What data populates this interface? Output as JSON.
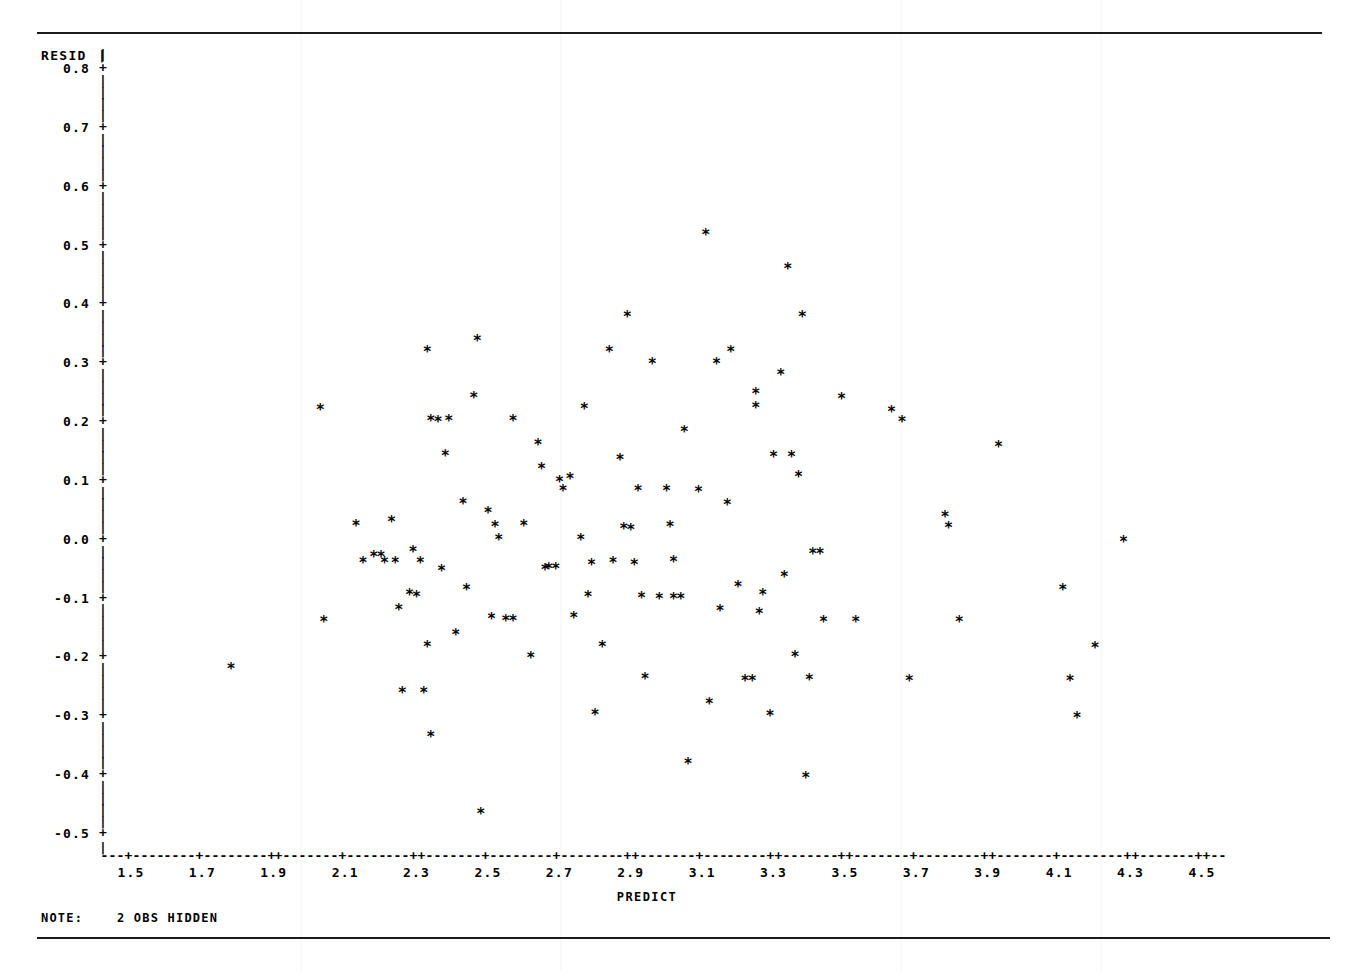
{
  "chart_data": {
    "type": "scatter",
    "title": "",
    "xlabel": "PREDICT",
    "ylabel": "RESID",
    "xlim": [
      1.4,
      4.6
    ],
    "ylim": [
      -0.55,
      0.8
    ],
    "grid": false,
    "legend": null,
    "marker": "*",
    "x_ticks": [
      "1.5",
      "1.7",
      "1.9",
      "2.1",
      "2.3",
      "2.5",
      "2.7",
      "2.9",
      "3.1",
      "3.3",
      "3.5",
      "3.7",
      "3.9",
      "4.1",
      "4.3",
      "4.5"
    ],
    "x_tick_values": [
      1.5,
      1.7,
      1.9,
      2.1,
      2.3,
      2.5,
      2.7,
      2.9,
      3.1,
      3.3,
      3.5,
      3.7,
      3.9,
      4.1,
      4.3,
      4.5
    ],
    "y_ticks": [
      "0.8",
      "0.7",
      "0.6",
      "0.5",
      "0.4",
      "0.3",
      "0.2",
      "0.1",
      "0.0",
      "-0.1",
      "-0.2",
      "-0.3",
      "-0.4",
      "-0.5"
    ],
    "y_tick_values": [
      0.8,
      0.7,
      0.6,
      0.5,
      0.4,
      0.3,
      0.2,
      0.1,
      0.0,
      -0.1,
      -0.2,
      -0.3,
      -0.4,
      -0.5
    ],
    "note": "2 OBS HIDDEN",
    "hidden_obs": 2,
    "points": [
      [
        1.78,
        -0.223
      ],
      [
        2.03,
        0.217
      ],
      [
        2.04,
        -0.143
      ],
      [
        2.13,
        0.02
      ],
      [
        2.15,
        -0.043
      ],
      [
        2.18,
        -0.033
      ],
      [
        2.2,
        -0.033
      ],
      [
        2.21,
        -0.043
      ],
      [
        2.23,
        0.027
      ],
      [
        2.24,
        -0.043
      ],
      [
        2.25,
        -0.122
      ],
      [
        2.26,
        -0.263
      ],
      [
        2.28,
        -0.098
      ],
      [
        2.29,
        -0.024
      ],
      [
        2.3,
        -0.1
      ],
      [
        2.31,
        -0.043
      ],
      [
        2.32,
        -0.263
      ],
      [
        2.33,
        0.316
      ],
      [
        2.33,
        -0.185
      ],
      [
        2.34,
        0.198
      ],
      [
        2.34,
        -0.338
      ],
      [
        2.36,
        0.196
      ],
      [
        2.37,
        -0.057
      ],
      [
        2.38,
        0.139
      ],
      [
        2.39,
        0.198
      ],
      [
        2.41,
        -0.165
      ],
      [
        2.43,
        0.057
      ],
      [
        2.44,
        -0.088
      ],
      [
        2.46,
        0.238
      ],
      [
        2.47,
        0.334
      ],
      [
        2.48,
        -0.47
      ],
      [
        2.5,
        0.042
      ],
      [
        2.51,
        -0.138
      ],
      [
        2.52,
        0.019
      ],
      [
        2.53,
        -0.004
      ],
      [
        2.55,
        -0.141
      ],
      [
        2.57,
        0.199
      ],
      [
        2.57,
        -0.141
      ],
      [
        2.6,
        0.02
      ],
      [
        2.62,
        -0.204
      ],
      [
        2.64,
        0.158
      ],
      [
        2.65,
        0.117
      ],
      [
        2.66,
        -0.054
      ],
      [
        2.67,
        -0.053
      ],
      [
        2.69,
        -0.053
      ],
      [
        2.7,
        0.095
      ],
      [
        2.71,
        0.08
      ],
      [
        2.73,
        0.1
      ],
      [
        2.74,
        -0.136
      ],
      [
        2.76,
        -0.004
      ],
      [
        2.77,
        0.218
      ],
      [
        2.78,
        -0.101
      ],
      [
        2.79,
        -0.046
      ],
      [
        2.8,
        -0.301
      ],
      [
        2.82,
        -0.185
      ],
      [
        2.84,
        0.315
      ],
      [
        2.85,
        -0.043
      ],
      [
        2.87,
        0.132
      ],
      [
        2.88,
        0.015
      ],
      [
        2.89,
        0.375
      ],
      [
        2.9,
        0.014
      ],
      [
        2.91,
        -0.046
      ],
      [
        2.92,
        0.079
      ],
      [
        2.93,
        -0.102
      ],
      [
        2.94,
        -0.24
      ],
      [
        2.96,
        0.296
      ],
      [
        2.98,
        -0.104
      ],
      [
        3.0,
        0.079
      ],
      [
        3.01,
        0.019
      ],
      [
        3.02,
        -0.042
      ],
      [
        3.02,
        -0.104
      ],
      [
        3.04,
        -0.104
      ],
      [
        3.05,
        0.179
      ],
      [
        3.06,
        -0.384
      ],
      [
        3.09,
        0.078
      ],
      [
        3.11,
        0.515
      ],
      [
        3.12,
        -0.283
      ],
      [
        3.14,
        0.296
      ],
      [
        3.15,
        -0.124
      ],
      [
        3.17,
        0.056
      ],
      [
        3.18,
        0.316
      ],
      [
        3.2,
        -0.084
      ],
      [
        3.22,
        -0.243
      ],
      [
        3.24,
        -0.243
      ],
      [
        3.25,
        0.221
      ],
      [
        3.25,
        0.245
      ],
      [
        3.26,
        -0.129
      ],
      [
        3.27,
        -0.098
      ],
      [
        3.29,
        -0.303
      ],
      [
        3.3,
        0.137
      ],
      [
        3.32,
        0.277
      ],
      [
        3.33,
        -0.066
      ],
      [
        3.34,
        0.456
      ],
      [
        3.35,
        0.137
      ],
      [
        3.36,
        -0.203
      ],
      [
        3.37,
        0.104
      ],
      [
        3.38,
        0.375
      ],
      [
        3.39,
        -0.409
      ],
      [
        3.4,
        -0.241
      ],
      [
        3.41,
        -0.027
      ],
      [
        3.43,
        -0.027
      ],
      [
        3.44,
        -0.143
      ],
      [
        3.49,
        0.235
      ],
      [
        3.53,
        -0.143
      ],
      [
        3.63,
        0.213
      ],
      [
        3.66,
        0.196
      ],
      [
        3.68,
        -0.243
      ],
      [
        3.78,
        0.035
      ],
      [
        3.79,
        0.016
      ],
      [
        3.82,
        -0.143
      ],
      [
        3.93,
        0.155
      ],
      [
        4.11,
        -0.089
      ],
      [
        4.13,
        -0.243
      ],
      [
        4.15,
        -0.306
      ],
      [
        4.2,
        -0.187
      ],
      [
        4.28,
        -0.008
      ]
    ]
  },
  "axis": {
    "y_name": "RESID",
    "y_name_bar": "|",
    "x_name": "PREDICT"
  },
  "note": {
    "label": "NOTE:",
    "text": "2 OBS HIDDEN"
  }
}
